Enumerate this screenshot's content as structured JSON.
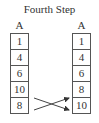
{
  "title": "Fourth Step",
  "left_array": {
    "label": "A",
    "cells": [
      "1",
      "4",
      "6",
      "10",
      "8"
    ]
  },
  "right_array": {
    "label": "A",
    "cells": [
      "1",
      "4",
      "6",
      "8",
      "10"
    ]
  },
  "swap": {
    "from_indices": [
      3,
      4
    ],
    "description": "10 and 8 swapped"
  },
  "colors": {
    "stroke": "#555555",
    "text": "#333333"
  }
}
